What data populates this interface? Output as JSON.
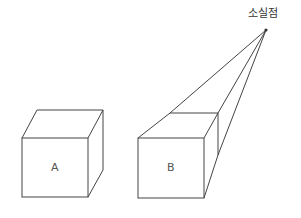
{
  "vanishing_point": {
    "label": "소실점",
    "x": 266,
    "y": 30
  },
  "cubes": [
    {
      "label": "A",
      "front": [
        [
          22,
          138
        ],
        [
          88,
          138
        ],
        [
          88,
          197
        ],
        [
          22,
          197
        ]
      ],
      "back_top_left": [
        37,
        110
      ],
      "back_top_right": [
        103,
        110
      ],
      "back_bottom_right": [
        103,
        170
      ]
    },
    {
      "label": "B",
      "front": [
        [
          138,
          138
        ],
        [
          204,
          138
        ],
        [
          204,
          198
        ],
        [
          138,
          198
        ]
      ],
      "back_top_left": [
        170,
        113
      ],
      "back_top_right": [
        218,
        113
      ],
      "back_bottom_right": [
        218,
        155
      ]
    }
  ],
  "colors": {
    "stroke": "#444444",
    "text": "#555555",
    "background": "#ffffff"
  }
}
